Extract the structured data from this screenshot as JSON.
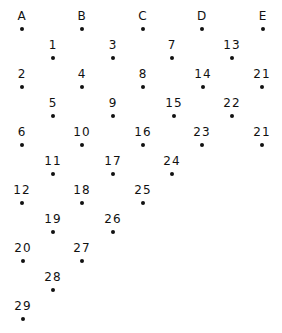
{
  "diagram": {
    "type": "dot-grid",
    "colors": {
      "dot": "#111111",
      "label": "#111111",
      "background": "#ffffff"
    },
    "nodes": [
      {
        "label": "A",
        "x": 22,
        "y": 29
      },
      {
        "label": "B",
        "x": 82,
        "y": 29
      },
      {
        "label": "C",
        "x": 143,
        "y": 29
      },
      {
        "label": "D",
        "x": 202,
        "y": 29
      },
      {
        "label": "E",
        "x": 263,
        "y": 29
      },
      {
        "label": "1",
        "x": 53,
        "y": 58
      },
      {
        "label": "3",
        "x": 113,
        "y": 58
      },
      {
        "label": "7",
        "x": 172,
        "y": 58
      },
      {
        "label": "13",
        "x": 232,
        "y": 58
      },
      {
        "label": "2",
        "x": 22,
        "y": 87
      },
      {
        "label": "4",
        "x": 82,
        "y": 87
      },
      {
        "label": "8",
        "x": 143,
        "y": 87
      },
      {
        "label": "14",
        "x": 203,
        "y": 87
      },
      {
        "label": "21",
        "x": 262,
        "y": 87
      },
      {
        "label": "5",
        "x": 53,
        "y": 116
      },
      {
        "label": "9",
        "x": 113,
        "y": 116
      },
      {
        "label": "15",
        "x": 174,
        "y": 116
      },
      {
        "label": "22",
        "x": 232,
        "y": 116
      },
      {
        "label": "6",
        "x": 22,
        "y": 145
      },
      {
        "label": "10",
        "x": 82,
        "y": 145
      },
      {
        "label": "16",
        "x": 143,
        "y": 145
      },
      {
        "label": "23",
        "x": 202,
        "y": 145
      },
      {
        "label": "21",
        "x": 262,
        "y": 145
      },
      {
        "label": "11",
        "x": 53,
        "y": 174
      },
      {
        "label": "17",
        "x": 113,
        "y": 174
      },
      {
        "label": "24",
        "x": 172,
        "y": 174
      },
      {
        "label": "12",
        "x": 22,
        "y": 203
      },
      {
        "label": "18",
        "x": 82,
        "y": 203
      },
      {
        "label": "25",
        "x": 143,
        "y": 203
      },
      {
        "label": "19",
        "x": 53,
        "y": 232
      },
      {
        "label": "26",
        "x": 113,
        "y": 232
      },
      {
        "label": "20",
        "x": 23,
        "y": 261
      },
      {
        "label": "27",
        "x": 82,
        "y": 261
      },
      {
        "label": "28",
        "x": 53,
        "y": 290
      },
      {
        "label": "29",
        "x": 23,
        "y": 319
      }
    ]
  }
}
